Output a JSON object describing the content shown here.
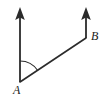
{
  "figure": {
    "type": "geometry-diagram",
    "background_color": "#ffffff",
    "stroke_color": "#2b2b2b",
    "labels": [
      {
        "id": "A",
        "text": "A",
        "x": 13,
        "y": 84
      },
      {
        "id": "B",
        "text": "B",
        "x": 91,
        "y": 30
      }
    ],
    "points": {
      "A": {
        "x": 20,
        "y": 82
      },
      "B": {
        "x": 86,
        "y": 38
      }
    },
    "arrows": [
      {
        "name": "arrow-from-A",
        "from": {
          "x": 20,
          "y": 82
        },
        "to": {
          "x": 20,
          "y": 8
        },
        "direction": "up",
        "head": "solid-triangle"
      },
      {
        "name": "arrow-from-B",
        "from": {
          "x": 86,
          "y": 38
        },
        "to": {
          "x": 86,
          "y": 8
        },
        "direction": "up",
        "head": "solid-triangle"
      }
    ],
    "segments": [
      {
        "name": "transversal-AB",
        "from": {
          "x": 20,
          "y": 82
        },
        "to": {
          "x": 86,
          "y": 38
        }
      }
    ],
    "arc": {
      "name": "angle-arc-at-A",
      "center": {
        "x": 20,
        "y": 82
      },
      "radius": 21,
      "start": {
        "x": 20,
        "y": 61
      },
      "end": {
        "x": 37.5,
        "y": 70.3
      }
    }
  }
}
